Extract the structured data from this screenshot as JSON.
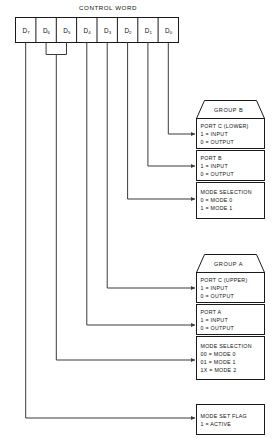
{
  "diagram": {
    "title": "CONTROL WORD",
    "colors": {
      "ink": "#1a1a1a",
      "wire": "#3a3a3a",
      "paper": "#ffffff"
    }
  },
  "control_word": {
    "bits": [
      {
        "name": "D7",
        "base": "D",
        "sub": "7"
      },
      {
        "name": "D6",
        "base": "D",
        "sub": "6"
      },
      {
        "name": "D5",
        "base": "D",
        "sub": "5"
      },
      {
        "name": "D4",
        "base": "D",
        "sub": "4"
      },
      {
        "name": "D3",
        "base": "D",
        "sub": "3"
      },
      {
        "name": "D2",
        "base": "D",
        "sub": "2"
      },
      {
        "name": "D1",
        "base": "D",
        "sub": "1"
      },
      {
        "name": "D0",
        "base": "D",
        "sub": "0"
      }
    ]
  },
  "group_b": {
    "label": "GROUP B",
    "blocks": [
      {
        "heading": "PORT C (LOWER)",
        "lines": [
          "1 = INPUT",
          "0 = OUTPUT"
        ]
      },
      {
        "heading": "PORT B",
        "lines": [
          "1 = INPUT",
          "0 = OUTPUT"
        ]
      },
      {
        "heading": "MODE SELECTION",
        "lines": [
          "0 = MODE 0",
          "1 = MODE 1"
        ]
      }
    ]
  },
  "group_a": {
    "label": "GROUP A",
    "blocks": [
      {
        "heading": "PORT C (UPPER)",
        "lines": [
          "1 = INPUT",
          "0 = OUTPUT"
        ]
      },
      {
        "heading": "PORT A",
        "lines": [
          "1 = INPUT",
          "0 = OUTPUT"
        ]
      },
      {
        "heading": "MODE SELECTION",
        "lines": [
          "00 = MODE 0",
          "01 = MODE 1",
          "1X = MODE 2"
        ]
      }
    ]
  },
  "mode_set_flag": {
    "heading": "MODE SET FLAG",
    "lines": [
      "1 = ACTIVE"
    ]
  }
}
